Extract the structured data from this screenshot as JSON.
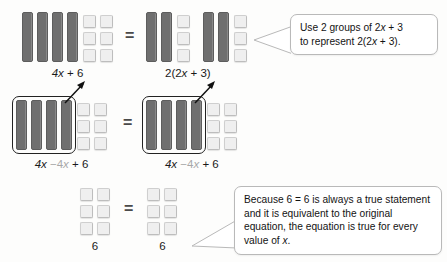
{
  "diagram": {
    "equals_symbol": "=",
    "colors": {
      "x_tile": "#6f6f6f",
      "unit_tile": "#efefef",
      "background": "#fdfdfc",
      "outline": "#222222"
    }
  },
  "rows": [
    {
      "id": "row-1",
      "left": {
        "label_parts": {
          "a": "4x",
          "b": "+ 6"
        },
        "label_text": "4x + 6",
        "x_tiles": 4,
        "unit_tiles": 6,
        "unit_columns": 2,
        "unit_rows": 3
      },
      "right": {
        "label_parts": {
          "a": "2(2x",
          "b": "+ 3)"
        },
        "label_text": "2(2x + 3)",
        "groups": 2,
        "x_tiles_per_group": 2,
        "unit_tiles_per_group": 3,
        "unit_columns_per_group": 1,
        "unit_rows_per_group": 3
      }
    },
    {
      "id": "row-2",
      "left": {
        "label_parts": {
          "a": "4x",
          "b": "−4x",
          "c": "+ 6"
        },
        "label_text": "4x −4x + 6",
        "x_tiles": 4,
        "unit_tiles": 6,
        "unit_columns": 2,
        "unit_rows": 3,
        "cancelled": true
      },
      "right": {
        "label_parts": {
          "a": "4x",
          "b": "−4x",
          "c": "+ 6"
        },
        "label_text": "4x −4x + 6",
        "x_tiles": 4,
        "unit_tiles": 6,
        "unit_columns": 2,
        "unit_rows": 3,
        "cancelled": true
      }
    },
    {
      "id": "row-3",
      "left": {
        "label_text": "6",
        "x_tiles": 0,
        "unit_tiles": 6,
        "unit_columns": 2,
        "unit_rows": 3
      },
      "right": {
        "label_text": "6",
        "x_tiles": 0,
        "unit_tiles": 6,
        "unit_columns": 2,
        "unit_rows": 3
      }
    }
  ],
  "callouts": [
    {
      "id": "callout-1",
      "line1_a": "Use 2 groups of 2",
      "line1_x": "x",
      "line1_b": " + 3",
      "line2_a": "to represent 2(2",
      "line2_x": "x",
      "line2_b": " + 3).",
      "text": "Use 2 groups of 2x + 3 to represent 2(2x + 3)."
    },
    {
      "id": "callout-2",
      "line1": "Because 6 = 6 is always a true statement",
      "line2": "and it is equivalent to the original",
      "line3": "equation, the equation is true for every",
      "line4_a": "value of ",
      "line4_x": "x",
      "line4_b": ".",
      "text": "Because 6 = 6 is always a true statement and it is equivalent to the original equation, the equation is true for every value of x."
    }
  ]
}
